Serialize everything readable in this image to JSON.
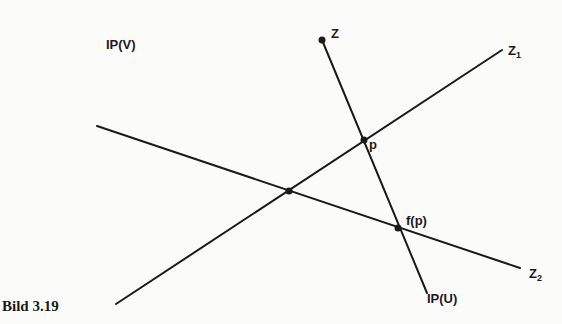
{
  "figure": {
    "caption": "Bild 3.19",
    "color": "#1a1a1a"
  },
  "labels": {
    "space_v": "IP(V)",
    "space_u": "IP(U)",
    "center": "Z",
    "z1_main": "Z",
    "z1_sub": "1",
    "z2_main": "Z",
    "z2_sub": "2",
    "point_p": "p",
    "point_fp": "f(p)"
  },
  "geometry": {
    "lines": [
      {
        "name": "line-z1",
        "from": [
          116,
          304
        ],
        "to": [
          502,
          50
        ]
      },
      {
        "name": "line-z2",
        "from": [
          97,
          126
        ],
        "to": [
          520,
          268
        ]
      },
      {
        "name": "line-projection",
        "from": [
          322,
          40
        ],
        "to": [
          427,
          293
        ]
      }
    ],
    "points": [
      {
        "name": "point-z",
        "at": [
          322,
          40
        ]
      },
      {
        "name": "point-p",
        "at": [
          364,
          140
        ]
      },
      {
        "name": "point-intersection",
        "at": [
          289,
          191
        ]
      },
      {
        "name": "point-fp",
        "at": [
          398,
          228
        ]
      }
    ]
  }
}
